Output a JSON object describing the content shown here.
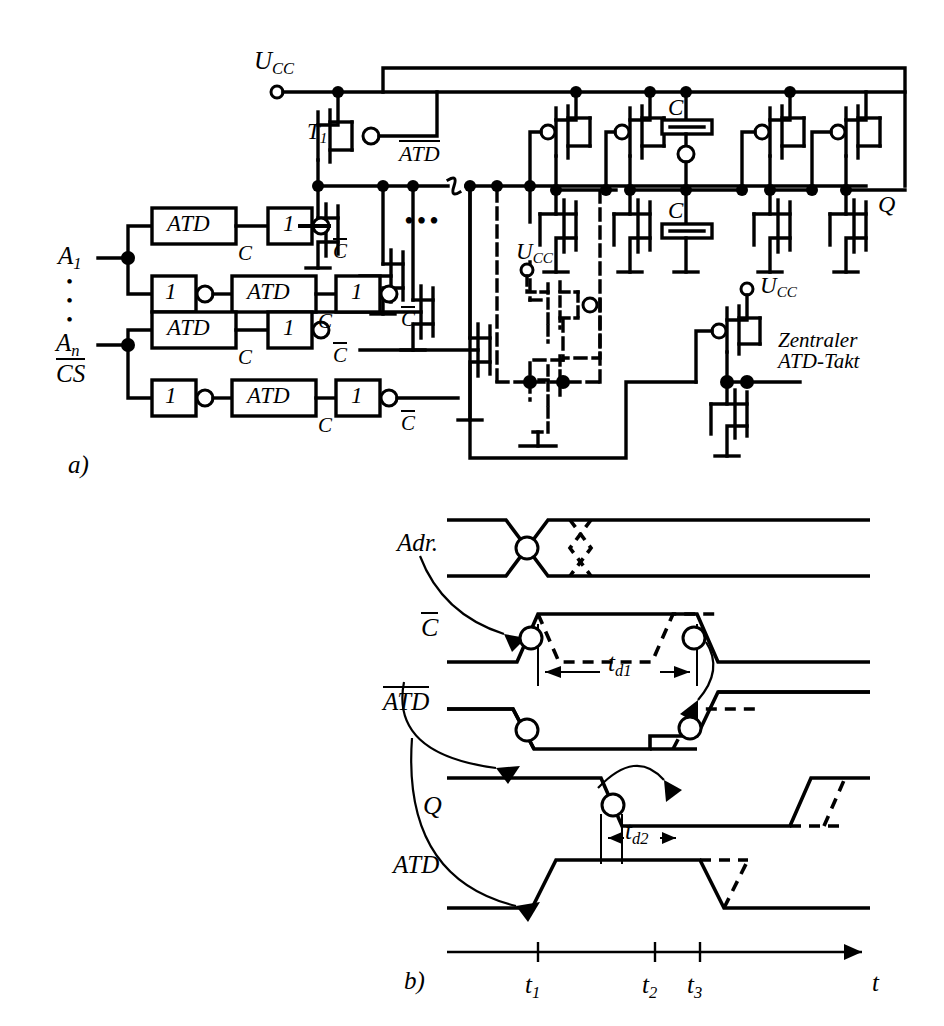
{
  "figure": {
    "part_a_label": "a)",
    "part_b_label": "b)"
  },
  "circuit": {
    "supply_label": "U",
    "supply_sub": "CC",
    "transistor_t1": "T",
    "transistor_t1_sub": "1",
    "atd_bar_node": "ATD",
    "output_label": "Q",
    "cap_label": "C",
    "clock_label_line1": "Zentraler",
    "clock_label_line2": "ATD-Takt",
    "ellipsis": "•••",
    "inputs": [
      {
        "name": "A",
        "sub": "1"
      },
      {
        "name": "A",
        "sub": "n"
      }
    ],
    "cs_label": "CS",
    "vertical_dots": "•",
    "atd_block_label": "ATD",
    "inv_block_label": "1",
    "c_label": "C",
    "c_bar_label": "C",
    "rows": [
      {
        "order": "atd-first",
        "out": "C"
      },
      {
        "order": "inv-first",
        "out": "C"
      },
      {
        "order": "atd-first",
        "out": "C"
      },
      {
        "order": "inv-first",
        "out": "C"
      }
    ]
  },
  "timing": {
    "signals": [
      "Adr.",
      "C",
      "ATD",
      "Q",
      "ATD"
    ],
    "signal_adr": "Adr.",
    "signal_cbar": "C",
    "signal_atdbar": "ATD",
    "signal_q": "Q",
    "signal_atd": "ATD",
    "delay1": "t",
    "delay1_sub": "d1",
    "delay2": "t",
    "delay2_sub": "d2",
    "axis_label": "t",
    "ticks": [
      {
        "label": "t",
        "sub": "1"
      },
      {
        "label": "t",
        "sub": "2"
      },
      {
        "label": "t",
        "sub": "3"
      }
    ]
  },
  "colors": {
    "ink": "#000000",
    "paper": "#ffffff"
  }
}
